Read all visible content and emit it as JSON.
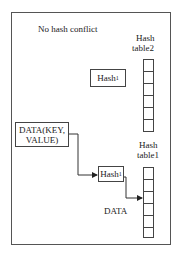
{
  "title": "No hash conflict",
  "tables": [
    {
      "id": "table2",
      "label_line1": "Hash",
      "label_line2": "table2",
      "cells": 6
    },
    {
      "id": "table1",
      "label_line1": "Hash",
      "label_line2": "table1",
      "cells": 6
    }
  ],
  "nodes": {
    "hash_upper": {
      "base": "Hash",
      "sub": "1"
    },
    "hash_lower": {
      "base": "Hash",
      "sub": "1"
    },
    "data_input": {
      "line1": "DATA(KEY,",
      "line2": "VALUE)"
    }
  },
  "annotations": {
    "data_label": "DATA"
  },
  "edges": [
    {
      "from": "data_input",
      "to": "hash_lower"
    },
    {
      "from": "hash_lower",
      "to": "table1"
    }
  ]
}
